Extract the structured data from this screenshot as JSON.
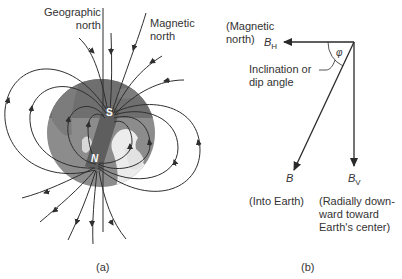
{
  "panel_a": {
    "caption": "(a)",
    "labels": {
      "geographic_north_line1": "Geographic",
      "geographic_north_line2": "north",
      "magnetic_north_line1": "Magnetic",
      "magnetic_north_line2": "north"
    },
    "magnet": {
      "south_pole": "S",
      "north_pole": "N"
    },
    "colors": {
      "globe_dark": "#7a7a7a",
      "globe_mid": "#8f8f8f",
      "land": "#e8e8e8",
      "magnet": "#5e5e5e",
      "lines": "#2f2f2f"
    }
  },
  "panel_b": {
    "caption": "(b)",
    "labels": {
      "magnetic_north_line1": "(Magnetic",
      "magnetic_north_line2": "north)",
      "bh_symbol": "B",
      "bh_sub": "H",
      "angle_symbol": "φ",
      "inclination_line1": "Inclination or",
      "inclination_line2": "dip angle",
      "b_symbol": "B",
      "bv_symbol": "B",
      "bv_sub": "V",
      "into_earth": "(Into Earth)",
      "radial_line1": "(Radially down-",
      "radial_line2": "ward toward",
      "radial_line3": "Earth's center)"
    }
  }
}
